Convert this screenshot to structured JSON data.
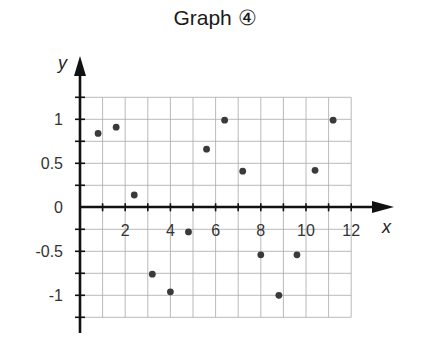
{
  "title": "Graph ④",
  "chart_data": {
    "type": "scatter",
    "title": "Graph ④",
    "xlabel": "x",
    "ylabel": "y",
    "xlim": [
      0,
      12
    ],
    "ylim": [
      -1.25,
      1.25
    ],
    "x_ticks": [
      2,
      4,
      6,
      8,
      10,
      12
    ],
    "x_tick_labels": [
      "2",
      "4",
      "6",
      "8",
      "10",
      "12"
    ],
    "y_ticks": [
      1,
      0.5,
      0,
      -0.5,
      -1
    ],
    "y_tick_labels": [
      "1",
      "0.5",
      "0",
      "-0.5",
      "-1"
    ],
    "grid": true,
    "grid_x_step": 1,
    "grid_y_step": 0.25,
    "legend": null,
    "series": [
      {
        "name": "points",
        "x": [
          0.8,
          1.6,
          2.4,
          3.2,
          4.0,
          4.8,
          5.6,
          6.4,
          7.2,
          8.0,
          8.8,
          9.6,
          10.4,
          11.2
        ],
        "y": [
          0.84,
          0.91,
          0.14,
          -0.76,
          -0.96,
          -0.28,
          0.66,
          0.99,
          0.41,
          -0.54,
          -1.0,
          -0.54,
          0.42,
          0.99
        ]
      }
    ]
  }
}
